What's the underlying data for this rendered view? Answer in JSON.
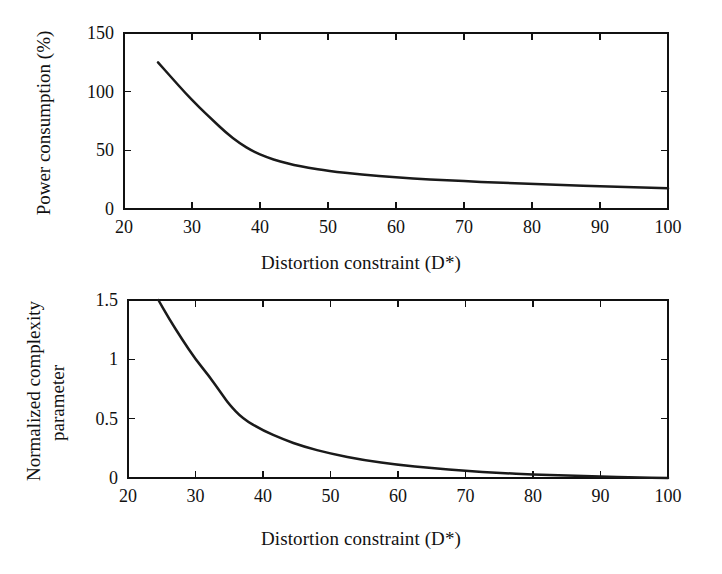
{
  "figure": {
    "background_color": "#ffffff",
    "line_color": "#1a1a1a",
    "axis_color": "#111111"
  },
  "chart_data": [
    {
      "type": "line",
      "panel": "top",
      "title": "",
      "xlabel": "Distortion constraint (D*)",
      "ylabel": "Power consumption (%)",
      "xlim": [
        20,
        100
      ],
      "ylim": [
        0,
        150
      ],
      "xticks": [
        20,
        30,
        40,
        50,
        60,
        70,
        80,
        90,
        100
      ],
      "xticklabels": [
        "20",
        "30",
        "40",
        "50",
        "60",
        "70",
        "80",
        "90",
        "100"
      ],
      "yticks": [
        0,
        50,
        100,
        150
      ],
      "yticklabels": [
        "0",
        "50",
        "100",
        "150"
      ],
      "grid": false,
      "legend": false,
      "tick_direction": "in",
      "series": [
        {
          "name": "Power consumption",
          "x": [
            25,
            27,
            29,
            31,
            33,
            35,
            37,
            39,
            41,
            43,
            45,
            47,
            50,
            55,
            60,
            65,
            70,
            75,
            80,
            85,
            90,
            95,
            100
          ],
          "y": [
            125,
            112,
            99,
            87,
            76,
            65,
            56,
            49,
            44,
            40.5,
            37.5,
            35.3,
            32.5,
            29.2,
            27.0,
            25.2,
            23.7,
            22.5,
            21.3,
            20.3,
            19.4,
            18.5,
            17.6
          ]
        }
      ]
    },
    {
      "type": "line",
      "panel": "bottom",
      "title": "",
      "xlabel": "Distortion constraint (D*)",
      "ylabel": "Normalized complexity parameter",
      "ylabel_line1": "Normalized complexity",
      "ylabel_line2": "parameter",
      "xlim": [
        20,
        100
      ],
      "ylim": [
        0,
        1.5
      ],
      "xticks": [
        20,
        30,
        40,
        50,
        60,
        70,
        80,
        90,
        100
      ],
      "xticklabels": [
        "20",
        "30",
        "40",
        "50",
        "60",
        "70",
        "80",
        "90",
        "100"
      ],
      "yticks": [
        0,
        0.5,
        1,
        1.5
      ],
      "yticklabels": [
        "0",
        "0.5",
        "1",
        "1.5"
      ],
      "grid": false,
      "legend": false,
      "tick_direction": "in",
      "series": [
        {
          "name": "Normalized complexity parameter",
          "x": [
            24.5,
            26,
            28,
            30,
            32,
            34,
            35,
            37,
            40,
            43,
            46,
            50,
            55,
            60,
            65,
            70,
            75,
            80,
            85,
            90,
            95,
            100
          ],
          "y": [
            1.5,
            1.35,
            1.17,
            1.0,
            0.86,
            0.7,
            0.62,
            0.5,
            0.4,
            0.325,
            0.265,
            0.205,
            0.15,
            0.11,
            0.082,
            0.06,
            0.043,
            0.03,
            0.02,
            0.012,
            0.006,
            0.0
          ]
        }
      ]
    }
  ]
}
